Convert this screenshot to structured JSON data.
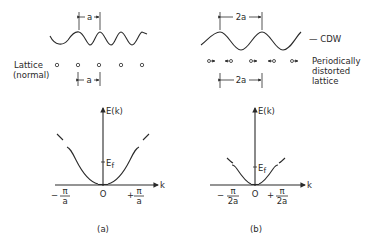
{
  "panel_a": {
    "spacing_top": "a",
    "spacing_bottom": "a",
    "lattice_label_line1": "Lattice",
    "lattice_label_line2": "(normal)",
    "plot": {
      "y_axis_label": "E(k)",
      "x_axis_label": "k",
      "fermi_label": "E",
      "fermi_sub": "f",
      "origin_label": "O",
      "left_tick_sign": "−",
      "left_tick_num": "π",
      "left_tick_den": "a",
      "right_tick_sign": "+",
      "right_tick_num": "π",
      "right_tick_den": "a"
    },
    "caption": "(a)"
  },
  "panel_b": {
    "spacing_top": "2a",
    "spacing_bottom": "2a",
    "wave_label": "— CDW",
    "lattice_label_line1": "Periodically",
    "lattice_label_line2": "distorted",
    "lattice_label_line3": "lattice",
    "plot": {
      "y_axis_label": "E(k)",
      "x_axis_label": "k",
      "fermi_label": "E",
      "fermi_sub": "f",
      "origin_label": "O",
      "left_tick_sign": "−",
      "left_tick_num": "π",
      "left_tick_den": "2a",
      "right_tick_sign": "+",
      "right_tick_num": "π",
      "right_tick_den": "2a"
    },
    "caption": "(b)"
  }
}
